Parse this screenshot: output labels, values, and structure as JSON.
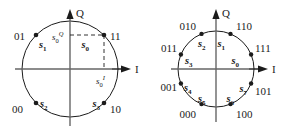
{
  "figure": {
    "background_color": "#ffffff",
    "stroke_color": "#1b1b1b",
    "axis_color": "#555555"
  },
  "panels": [
    {
      "id": "qpsk",
      "name": "qpsk-constellation",
      "circle": {
        "cx": 70,
        "cy": 69,
        "r": 48
      },
      "axes": {
        "q_label": "Q",
        "i_label": "I"
      },
      "projections": [
        {
          "name": "q-projection-label",
          "base": "s",
          "sub": "0",
          "sup": "Q",
          "x": 58,
          "y": 38
        },
        {
          "name": "i-projection-label",
          "base": "s",
          "sub": "0",
          "sup": "I",
          "x": 72,
          "y": 82
        }
      ],
      "points": [
        {
          "name": "s1",
          "bits": "01",
          "sym_base": "s",
          "sym_sub": "1",
          "angle_deg": 135,
          "bit_x": 14,
          "bit_y": 40,
          "sym_x": 33,
          "sym_y": 50
        },
        {
          "name": "s0",
          "bits": "11",
          "sym_base": "s",
          "sym_sub": "0",
          "angle_deg": 45,
          "bit_x": 110,
          "bit_y": 40,
          "sym_x": 86,
          "sym_y": 50
        },
        {
          "name": "s2",
          "bits": "00",
          "sym_base": "s",
          "sym_sub": "2",
          "angle_deg": 225,
          "bit_x": 12,
          "bit_y": 113,
          "sym_x": 40,
          "sym_y": 110
        },
        {
          "name": "s3",
          "bits": "10",
          "sym_base": "s",
          "sym_sub": "3",
          "angle_deg": 315,
          "bit_x": 105,
          "bit_y": 113,
          "sym_x": 78,
          "sym_y": 107
        }
      ]
    },
    {
      "id": "psk8",
      "name": "8psk-constellation",
      "circle": {
        "cx": 216,
        "cy": 69,
        "r": 38
      },
      "axes": {
        "q_label": "Q",
        "i_label": "I"
      },
      "points": [
        {
          "name": "s0",
          "bits": "111",
          "sym_base": "s",
          "sym_sub": "0",
          "angle_deg": 22.5,
          "bit_x": 256,
          "bit_y": 48,
          "sym_x": 234,
          "sym_y": 59
        },
        {
          "name": "s1",
          "bits": "110",
          "sym_base": "s",
          "sym_sub": "1",
          "angle_deg": 67.5,
          "bit_x": 234,
          "bit_y": 26,
          "sym_x": 218,
          "sym_y": 43
        },
        {
          "name": "s2",
          "bits": "010",
          "sym_base": "s",
          "sym_sub": "2",
          "angle_deg": 112.5,
          "bit_x": 178,
          "bit_y": 26,
          "sym_x": 196,
          "sym_y": 43
        },
        {
          "name": "s3",
          "bits": "011",
          "sym_base": "s",
          "sym_sub": "3",
          "angle_deg": 157.5,
          "bit_x": 156,
          "bit_y": 48,
          "sym_x": 183,
          "sym_y": 59
        },
        {
          "name": "s4",
          "bits": "001",
          "sym_base": "s",
          "sym_sub": "4",
          "angle_deg": 202.5,
          "bit_x": 155,
          "bit_y": 94,
          "sym_x": 182,
          "sym_y": 92
        },
        {
          "name": "s5",
          "bits": "000",
          "sym_base": "s",
          "sym_sub": "5",
          "angle_deg": 247.5,
          "bit_x": 177,
          "bit_y": 119,
          "sym_x": 195,
          "sym_y": 107
        },
        {
          "name": "s6",
          "bits": "100",
          "sym_base": "s",
          "sym_sub": "6",
          "angle_deg": 292.5,
          "bit_x": 233,
          "bit_y": 119,
          "sym_x": 218,
          "sym_y": 107
        },
        {
          "name": "s7",
          "bits": "101",
          "sym_base": "s",
          "sym_sub": "7",
          "angle_deg": 337.5,
          "bit_x": 255,
          "bit_y": 97,
          "sym_x": 235,
          "sym_y": 88
        }
      ]
    }
  ]
}
